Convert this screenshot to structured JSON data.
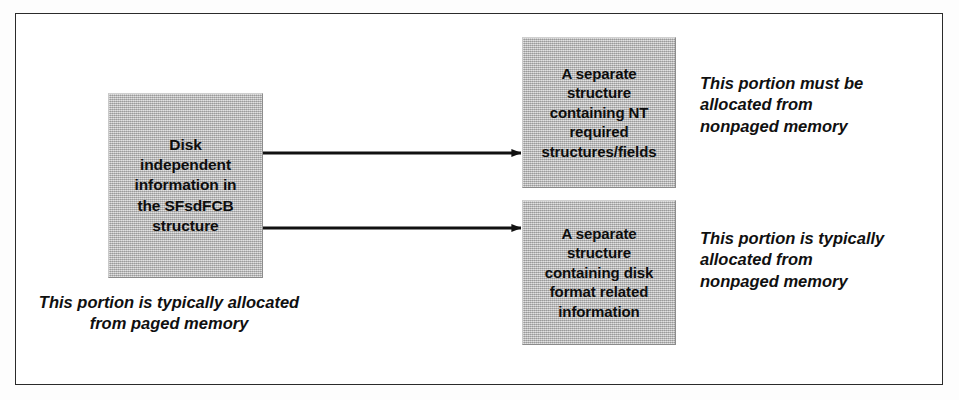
{
  "figure": {
    "frame": {
      "present": true,
      "border_color": "#2b2b2b"
    },
    "colors": {
      "box_fill": "#b9b9b9",
      "box_shadow": "#3a3a3a",
      "text": "#0d0d0d",
      "arrow": "#111111",
      "frame_border": "#2b2b2b",
      "page_background": "#ffffff"
    }
  },
  "boxes": [
    {
      "id": "fcb",
      "name": "disk-independent-information-box",
      "lines": [
        "Disk",
        "independent",
        "information in",
        "the SFsdFCB",
        "structure"
      ]
    },
    {
      "id": "nt",
      "name": "nt-required-structures-box",
      "lines": [
        "A separate",
        "structure",
        "containing NT",
        "required",
        "structures/fields"
      ]
    },
    {
      "id": "disk",
      "name": "disk-format-information-box",
      "lines": [
        "A separate",
        "structure",
        "containing disk",
        "format related",
        "information"
      ]
    }
  ],
  "captions": [
    {
      "id": "paged",
      "name": "paged-memory-caption",
      "lines": [
        "This portion is typically allocated",
        "from paged memory"
      ]
    },
    {
      "id": "nonpaged_top",
      "name": "nonpaged-memory-required-caption",
      "lines": [
        "This portion must be",
        "allocated from",
        "nonpaged memory"
      ]
    },
    {
      "id": "nonpaged_bottom",
      "name": "nonpaged-memory-typical-caption",
      "lines": [
        "This portion is typically",
        "allocated from",
        "nonpaged memory"
      ]
    }
  ],
  "arrows": [
    {
      "id": "arrow_top",
      "name": "arrow-fcb-to-nt-structure",
      "from": "fcb",
      "to": "nt",
      "direction": "right",
      "label": ""
    },
    {
      "id": "arrow_bottom",
      "name": "arrow-fcb-to-disk-structure",
      "from": "fcb",
      "to": "disk",
      "direction": "right",
      "label": ""
    }
  ]
}
